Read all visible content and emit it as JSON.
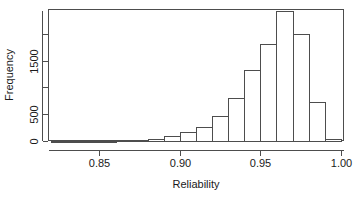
{
  "chart_data": {
    "type": "bar",
    "title": "",
    "subtitle": "",
    "xlabel": "Reliability",
    "ylabel": "Frequency",
    "xlim": [
      0.818,
      1.002
    ],
    "ylim": [
      0,
      2460
    ],
    "grid": false,
    "legend": "none",
    "bin_width": 0.01,
    "x_tick_labels": [
      "0.85",
      "0.90",
      "0.95",
      "1.00"
    ],
    "x_tick_values": [
      0.85,
      0.9,
      0.95,
      1.0
    ],
    "y_tick_labels": [
      "0",
      "500",
      "",
      "1500",
      ""
    ],
    "y_tick_values": [
      0,
      500,
      1000,
      1500,
      2000
    ],
    "bin_edges": [
      0.82,
      0.83,
      0.84,
      0.85,
      0.86,
      0.87,
      0.88,
      0.89,
      0.9,
      0.91,
      0.92,
      0.93,
      0.94,
      0.95,
      0.96,
      0.97,
      0.98,
      0.99,
      1.0
    ],
    "categories": [
      "0.82-0.83",
      "0.83-0.84",
      "0.84-0.85",
      "0.85-0.86",
      "0.86-0.87",
      "0.87-0.88",
      "0.88-0.89",
      "0.89-0.90",
      "0.90-0.91",
      "0.91-0.92",
      "0.92-0.93",
      "0.93-0.94",
      "0.94-0.95",
      "0.95-0.96",
      "0.96-0.97",
      "0.97-0.98",
      "0.98-0.99",
      "0.99-1.00"
    ],
    "values": [
      3,
      4,
      6,
      8,
      12,
      20,
      35,
      100,
      160,
      270,
      460,
      800,
      1330,
      1810,
      2420,
      1990,
      720,
      40
    ]
  },
  "plot": {
    "frame": {
      "left": 48,
      "right": 344,
      "top": 9,
      "bottom": 141
    },
    "x_axis_pixels": {
      "start": 48,
      "end": 344
    },
    "y_axis_pixels": {
      "zero": 141,
      "top": 9
    }
  }
}
